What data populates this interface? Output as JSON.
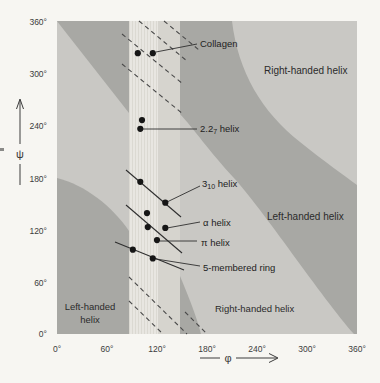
{
  "page": {
    "background": "#f7f6f2"
  },
  "axes": {
    "x_ticks": [
      "0°",
      "60°",
      "120°",
      "180°",
      "240°",
      "300°",
      "360°"
    ],
    "y_ticks": [
      "360°",
      "300°",
      "240°",
      "180°",
      "120°",
      "60°",
      "0°"
    ],
    "x_axis_symbol": "φ",
    "y_axis_symbol": "ψ"
  },
  "region_labels": {
    "right_handed_top": "Right-handed helix",
    "left_handed_right": "Left-handed helix",
    "left_handed_bottom_line1": "Left-handed",
    "left_handed_bottom_line2": "helix",
    "right_handed_bottom": "Right-handed helix"
  },
  "point_labels": {
    "collagen": "Collagen",
    "helix227_base": "2.2",
    "helix227_sub": "7",
    "helix227_rest": " helix",
    "helix310_base": "3",
    "helix310_sub": "10",
    "helix310_rest": " helix",
    "alpha": "α helix",
    "pi": "π helix",
    "ring5": "5-membered ring"
  },
  "colors": {
    "band_dark": "#a8a8a4",
    "band_light": "#c9c8c4",
    "strip_bright": "#e8e6e1",
    "strip_light": "#d6d4ce",
    "point": "#161616"
  },
  "chart_data": {
    "type": "scatter",
    "xlabel": "φ",
    "ylabel": "ψ",
    "xlim": [
      0,
      360
    ],
    "ylim": [
      0,
      360
    ],
    "x_tick_values": [
      0,
      60,
      120,
      180,
      240,
      300,
      360
    ],
    "y_tick_values": [
      0,
      60,
      120,
      180,
      240,
      300,
      360
    ],
    "grid": false,
    "legend_position": "none",
    "series": [
      {
        "id": "collagen",
        "name": "Collagen",
        "points": [
          [
            97,
            323
          ],
          [
            115,
            323
          ]
        ]
      },
      {
        "id": "helix227",
        "name": "2.2₇ helix",
        "points": [
          [
            102,
            246
          ],
          [
            100,
            236
          ]
        ]
      },
      {
        "id": "helix310",
        "name": "3₁₀ helix",
        "points": [
          [
            100,
            175
          ],
          [
            130,
            151
          ]
        ]
      },
      {
        "id": "alpha",
        "name": "α helix",
        "points": [
          [
            108,
            139
          ],
          [
            109,
            123
          ],
          [
            130,
            122
          ]
        ]
      },
      {
        "id": "pi",
        "name": "π helix",
        "points": [
          [
            120,
            108
          ]
        ]
      },
      {
        "id": "ring5",
        "name": "5-membered ring",
        "points": [
          [
            91,
            97
          ],
          [
            115,
            87
          ]
        ]
      }
    ],
    "regions": [
      "Right-handed helix (upper right, light band)",
      "Left-handed helix (right, dark band)",
      "Left-handed helix (lower left, dark band)",
      "Right-handed helix (bottom, light band)",
      "Fully allowed vertical strip near φ = 90°–150° (hatched bright band)"
    ]
  }
}
